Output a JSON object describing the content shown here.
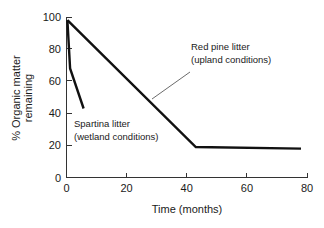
{
  "chart_data": {
    "type": "line",
    "title": "",
    "xlabel": "Time (months)",
    "ylabel": "% Organic matter remaining",
    "xlim": [
      0,
      80
    ],
    "ylim": [
      0,
      100
    ],
    "xticks": [
      0,
      20,
      40,
      60,
      80
    ],
    "yticks": [
      0,
      20,
      40,
      60,
      80,
      100
    ],
    "grid": false,
    "legend_position": "annotations-inline",
    "series": [
      {
        "name": "Red pine litter (upland conditions)",
        "x": [
          0.3,
          43,
          78
        ],
        "values": [
          98,
          19,
          18
        ]
      },
      {
        "name": "Spartina litter (wetland conditions)",
        "x": [
          0.3,
          1.2,
          5.7
        ],
        "values": [
          98,
          68,
          43
        ]
      }
    ],
    "annotations": [
      {
        "id": "red-pine",
        "line1": "Red pine litter",
        "line2": "(upland conditions)",
        "points_to_x": 26,
        "points_to_y": 48
      },
      {
        "id": "spartina",
        "line1": "Spartina litter",
        "line2": "(wetland conditions)",
        "points_to_x": 4,
        "points_to_y": 36
      }
    ],
    "ytick_labels": [
      "0",
      "20",
      "40",
      "60",
      "80",
      "100"
    ],
    "xtick_labels": [
      "0",
      "20",
      "40",
      "60",
      "80"
    ]
  },
  "axes": {
    "x_title": "Time (months)",
    "y_title_line1": "% Organic matter",
    "y_title_line2": "remaining"
  },
  "colors": {
    "line": "#111111",
    "axis": "#333333",
    "text": "#1a1a1a",
    "background": "#ffffff",
    "leader": "#5a5a5a"
  }
}
